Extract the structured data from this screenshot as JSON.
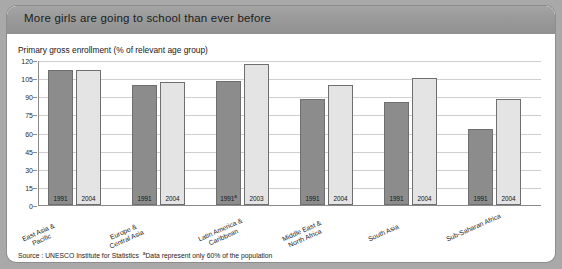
{
  "header": {
    "title": "More girls are going to school than ever before"
  },
  "subtitle": "Primary gross enrollment (% of relevant age group)",
  "footnote": {
    "source": "Source : UNESCO Institute for Statistics",
    "marker": "a",
    "note": "Data represent only 60% of the population"
  },
  "colors": {
    "page_background": "#a9a9a9",
    "card_background": "#ffffff",
    "header_band": "#969696",
    "bar_dark": "#8c8c8c",
    "bar_light": "#e4e4e4",
    "gridline": "#cfcfcf",
    "axis": "#8a8a8a"
  },
  "chart_data": {
    "type": "bar",
    "title": "More girls are going to school than ever before",
    "subtitle": "Primary gross enrollment (% of relevant age group)",
    "xlabel": "",
    "ylabel": "",
    "ylim": [
      0,
      120
    ],
    "yticks": [
      0,
      15,
      30,
      45,
      60,
      75,
      90,
      105,
      120
    ],
    "grid": true,
    "legend_position": "none",
    "categories": [
      "East Asia & Pacific",
      "Europe & Central Asia",
      "Latin America & Caribbean",
      "Middle East & North Africa",
      "South Asia",
      "Sub-Saharan Africa"
    ],
    "series": [
      {
        "name": "1991",
        "values": [
          112,
          99,
          103,
          88,
          85,
          63
        ]
      },
      {
        "name": "2004",
        "values": [
          112,
          102,
          117,
          99,
          105,
          88
        ]
      }
    ],
    "bars": [
      {
        "group": "East Asia & Pacific",
        "year": "1991",
        "year_suffix": "",
        "value": 112,
        "shade": "dark"
      },
      {
        "group": "East Asia & Pacific",
        "year": "2004",
        "year_suffix": "",
        "value": 112,
        "shade": "light"
      },
      {
        "group": "Europe & Central Asia",
        "year": "1991",
        "year_suffix": "",
        "value": 99,
        "shade": "dark"
      },
      {
        "group": "Europe & Central Asia",
        "year": "2004",
        "year_suffix": "",
        "value": 102,
        "shade": "light"
      },
      {
        "group": "Latin America & Caribbean",
        "year": "1991",
        "year_suffix": "a",
        "value": 103,
        "shade": "dark"
      },
      {
        "group": "Latin America & Caribbean",
        "year": "2003",
        "year_suffix": "",
        "value": 117,
        "shade": "light"
      },
      {
        "group": "Middle East & North Africa",
        "year": "1991",
        "year_suffix": "",
        "value": 88,
        "shade": "dark"
      },
      {
        "group": "Middle East & North Africa",
        "year": "2004",
        "year_suffix": "",
        "value": 99,
        "shade": "light"
      },
      {
        "group": "South Asia",
        "year": "1991",
        "year_suffix": "",
        "value": 85,
        "shade": "dark"
      },
      {
        "group": "South Asia",
        "year": "2004",
        "year_suffix": "",
        "value": 105,
        "shade": "light"
      },
      {
        "group": "Sub-Saharan Africa",
        "year": "1991",
        "year_suffix": "",
        "value": 63,
        "shade": "dark"
      },
      {
        "group": "Sub-Saharan Africa",
        "year": "2004",
        "year_suffix": "",
        "value": 88,
        "shade": "light"
      }
    ],
    "group_layout": [
      {
        "label": "East Asia & Pacific",
        "left": 9,
        "label_left": 14
      },
      {
        "label": "Europe & Central Asia",
        "left": 93,
        "label_left": 98
      },
      {
        "label": "Latin America & Caribbean",
        "left": 177,
        "label_left": 190
      },
      {
        "label": "Middle East & North Africa",
        "left": 261,
        "label_left": 274
      },
      {
        "label": "South Asia",
        "left": 345,
        "label_left": 360
      },
      {
        "label": "Sub-Saharan Africa",
        "left": 429,
        "label_left": 438
      }
    ]
  }
}
